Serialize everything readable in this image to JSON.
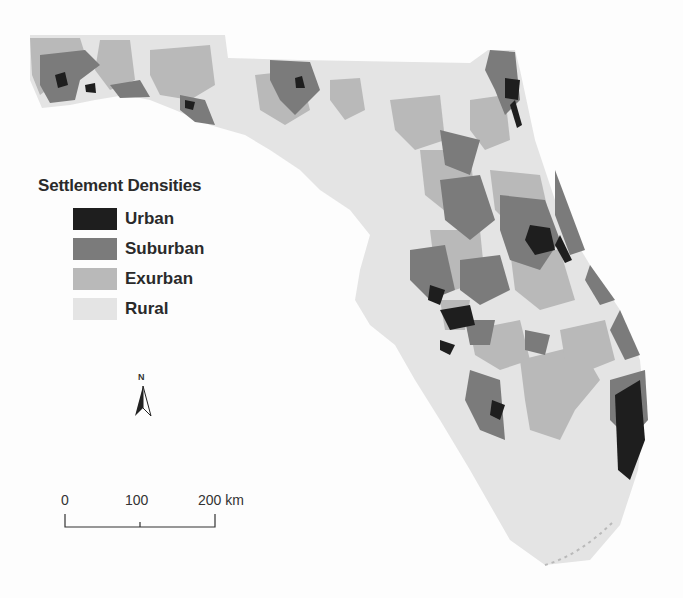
{
  "map": {
    "subject": "Florida",
    "colors": {
      "urban": "#1e1e1e",
      "suburban": "#7b7b7b",
      "exurban": "#b9b9b9",
      "rural": "#e4e4e4",
      "background": "#fdfdfd"
    }
  },
  "legend": {
    "title": "Settlement Densities",
    "items": [
      {
        "label": "Urban",
        "color": "#1e1e1e"
      },
      {
        "label": "Suburban",
        "color": "#7b7b7b"
      },
      {
        "label": "Exurban",
        "color": "#b9b9b9"
      },
      {
        "label": "Rural",
        "color": "#e4e4e4"
      }
    ]
  },
  "north_arrow": {
    "label": "N"
  },
  "scale_bar": {
    "ticks": [
      "0",
      "100",
      "200 km"
    ]
  }
}
